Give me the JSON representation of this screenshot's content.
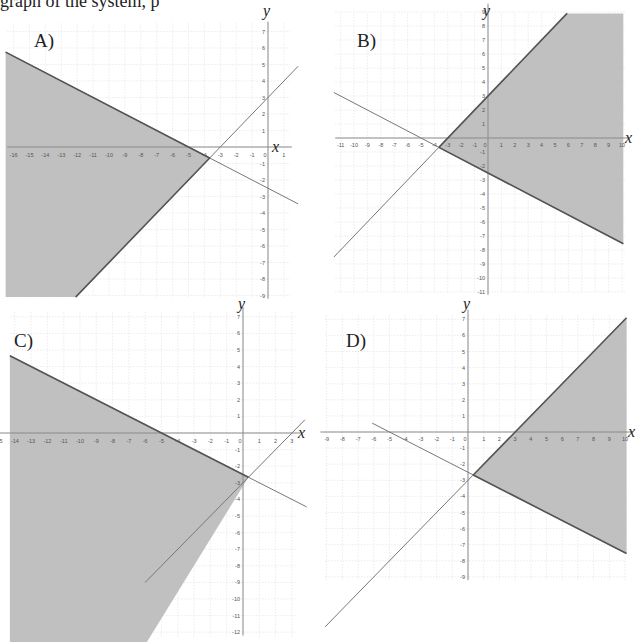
{
  "header_fragment": "graph of the system, p",
  "style": {
    "shade_color": "#b5b5b5",
    "boundary_color": "#555555",
    "line_color": "#777777",
    "grid_color": "#e4e4e4",
    "axis_color": "#8a8a8a",
    "tick_text_color": "#555555"
  },
  "chart_data": [
    {
      "type": "area",
      "title": "A)",
      "xlabel": "x",
      "ylabel": "y",
      "xlim": [
        -16,
        1
      ],
      "ylim": [
        -9,
        7
      ],
      "x_ticks": [
        -16,
        -15,
        -14,
        -13,
        -12,
        -11,
        -10,
        -9,
        -8,
        -7,
        -6,
        -5,
        -4,
        -3,
        -2,
        -1,
        0,
        1
      ],
      "y_ticks": [
        -9,
        -8,
        -7,
        -6,
        -5,
        -4,
        -3,
        -2,
        -1,
        1,
        2,
        3,
        4,
        5,
        6,
        7
      ],
      "grid": true,
      "lines": [
        {
          "equation": "y = -0.5x - 2.5",
          "slope": -0.5,
          "intercept": -2.5
        },
        {
          "equation": "y = x + 3",
          "slope": 1,
          "intercept": 3
        }
      ],
      "shaded_region": "y <= -0.5x - 2.5 and y >= x + 3",
      "vertex": [
        -3.67,
        -0.67
      ]
    },
    {
      "type": "area",
      "title": "B)",
      "xlabel": "x",
      "ylabel": "y",
      "xlim": [
        -11,
        10
      ],
      "ylim": [
        -11,
        9
      ],
      "x_ticks": [
        -11,
        -10,
        -9,
        -8,
        -7,
        -6,
        -5,
        -4,
        -3,
        -2,
        -1,
        0,
        1,
        2,
        3,
        4,
        5,
        6,
        7,
        8,
        9,
        10
      ],
      "y_ticks": [
        -11,
        -10,
        -9,
        -8,
        -7,
        -6,
        -5,
        -4,
        -3,
        -2,
        -1,
        1,
        2,
        3,
        4,
        5,
        6,
        7,
        8,
        9
      ],
      "grid": true,
      "lines": [
        {
          "equation": "y = x + 3",
          "slope": 1,
          "intercept": 3
        },
        {
          "equation": "y = -0.5x - 2.5",
          "slope": -0.5,
          "intercept": -2.5
        }
      ],
      "shaded_region": "y <= x + 3 and y >= -0.5x - 2.5",
      "vertex": [
        -3.67,
        -0.67
      ]
    },
    {
      "type": "area",
      "title": "C)",
      "xlabel": "x",
      "ylabel": "y",
      "xlim": [
        -15,
        3
      ],
      "ylim": [
        -12,
        7
      ],
      "x_ticks": [
        -15,
        -14,
        -13,
        -12,
        -11,
        -10,
        -9,
        -8,
        -7,
        -6,
        -5,
        -4,
        -3,
        -2,
        -1,
        0,
        1,
        2,
        3
      ],
      "y_ticks": [
        -12,
        -11,
        -10,
        -9,
        -8,
        -7,
        -6,
        -5,
        -4,
        -3,
        -2,
        -1,
        1,
        2,
        3,
        4,
        5,
        6,
        7
      ],
      "grid": true,
      "lines": [
        {
          "equation": "y = -0.5x - 2.5",
          "slope": -0.5,
          "intercept": -2.5
        },
        {
          "equation": "y = x - 3",
          "slope": 1,
          "intercept": -3
        }
      ],
      "shaded_region": "y <= -0.5x - 2.5 and y >= x - 3",
      "vertex": [
        0.33,
        -2.67
      ]
    },
    {
      "type": "area",
      "title": "D)",
      "xlabel": "x",
      "ylabel": "y",
      "xlim": [
        -9,
        10
      ],
      "ylim": [
        -9,
        7
      ],
      "x_ticks": [
        -9,
        -8,
        -7,
        -6,
        -5,
        -4,
        -3,
        -2,
        -1,
        0,
        1,
        2,
        3,
        4,
        5,
        6,
        7,
        8,
        9,
        10
      ],
      "y_ticks": [
        -9,
        -8,
        -7,
        -6,
        -5,
        -4,
        -3,
        -2,
        -1,
        1,
        2,
        3,
        4,
        5,
        6,
        7
      ],
      "grid": true,
      "lines": [
        {
          "equation": "y = x - 3",
          "slope": 1,
          "intercept": -3
        },
        {
          "equation": "y = -0.5x - 2.5",
          "slope": -0.5,
          "intercept": -2.5
        }
      ],
      "shaded_region": "y <= x - 3 and y >= -0.5x - 2.5",
      "vertex": [
        0.33,
        -2.67
      ]
    }
  ],
  "layout": [
    {
      "ox": 268,
      "oy": 147,
      "sx": 15.9,
      "sy": 16.5,
      "left": 6,
      "right": 290,
      "top": 22,
      "bottom": 297,
      "label_x": 34,
      "label_y": 30,
      "xlab_x": 272,
      "ylab_y": 4,
      "shade_ext": {
        "x0": -16.5,
        "x1": 2.0,
        "y0": -9.1,
        "y1": 7.6
      },
      "line_ext": [
        [
          -16.5,
          1.9
        ],
        [
          -12.0,
          1.9
        ]
      ],
      "shade_poly": [
        [
          -16.5,
          5.75
        ],
        [
          -3.667,
          -0.667
        ],
        [
          -12.1,
          -9.1
        ],
        [
          -16.5,
          -9.1
        ]
      ],
      "xtick_y_off": 10
    },
    {
      "ox": 488,
      "oy": 138,
      "sx": 13.4,
      "sy": 14.0,
      "left": 333,
      "right": 625,
      "top": 14,
      "bottom": 292,
      "label_x": 357,
      "label_y": 30,
      "xlab_x": 625,
      "ylab_y": 4,
      "shade_ext": {},
      "line_ext": [
        [
          -11.5,
          5.9
        ],
        [
          -11.5,
          10.1
        ]
      ],
      "shade_poly": [
        [
          -3.667,
          -0.667
        ],
        [
          5.9,
          8.9
        ],
        [
          10.1,
          8.9
        ],
        [
          10.1,
          -7.55
        ]
      ],
      "xtick_y_off": 9
    },
    {
      "ox": 243,
      "oy": 433,
      "sx": 16.3,
      "sy": 16.6,
      "left": 10,
      "right": 296,
      "top": 312,
      "bottom": 642,
      "label_x": 14,
      "label_y": 330,
      "xlab_x": 298,
      "ylab_y": 297,
      "shade_ext": {},
      "line_ext": [
        [
          -14.3,
          3.9
        ],
        [
          -6.0,
          3.8
        ]
      ],
      "shade_poly": [
        [
          -14.3,
          4.65
        ],
        [
          0.333,
          -2.667
        ],
        [
          -5.9,
          -12.6
        ],
        [
          -14.3,
          -12.6
        ]
      ],
      "xtick_y_off": 10
    },
    {
      "ox": 468,
      "oy": 432,
      "sx": 15.7,
      "sy": 16.1,
      "left": 325,
      "right": 626,
      "top": 315,
      "bottom": 580,
      "label_x": 346,
      "label_y": 330,
      "xlab_x": 628,
      "ylab_y": 297,
      "shade_ext": {},
      "line_ext": [
        [
          -9.1,
          10.0
        ],
        [
          -6.1,
          10.0
        ]
      ],
      "shade_poly": [
        [
          0.333,
          -2.667
        ],
        [
          10.1,
          7.1
        ],
        [
          10.1,
          -7.55
        ]
      ],
      "xtick_y_off": 9
    }
  ]
}
